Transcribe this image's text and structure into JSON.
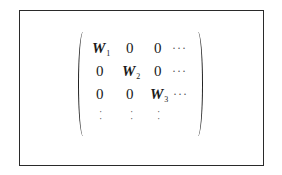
{
  "matrix": {
    "rows": [
      [
        "W",
        "0",
        "0",
        "···"
      ],
      [
        "0",
        "W",
        "0",
        "···"
      ],
      [
        "0",
        "0",
        "W",
        "···"
      ],
      [
        "·\n·",
        "·\n·",
        "·\n·",
        ""
      ]
    ],
    "subscripts": {
      "r0c0": "1",
      "r1c1": "2",
      "r2c2": "3"
    },
    "vertical_dots": "·",
    "horizontal_dots": "···"
  }
}
